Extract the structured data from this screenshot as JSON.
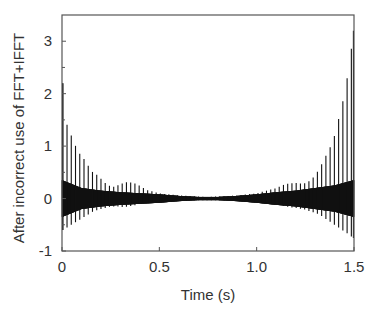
{
  "chart_data": {
    "type": "line",
    "title": "",
    "xlabel": "Time (s)",
    "ylabel": "After incorrect use of FFT+IFFT",
    "xlim": [
      0,
      1.5
    ],
    "ylim": [
      -1,
      3.5
    ],
    "grid": false,
    "legend": null,
    "xticks": [
      0,
      0.5,
      1.0,
      1.5
    ],
    "xtick_labels": [
      "0",
      "0.5",
      "1.0",
      "1.5"
    ],
    "yticks": [
      -1,
      0,
      1,
      2,
      3
    ],
    "ytick_labels": [
      "-1",
      "0",
      "1",
      "2",
      "3"
    ],
    "series": [
      {
        "name": "signal",
        "color": "#111111",
        "description": "Dense oscillation around 0 with periodic spikes; large spikes at both ends decaying toward the middle, small bump near t≈0.35 s and t≈1.15 s",
        "spike_peaks": {
          "t": [
            0.005,
            0.026,
            0.048,
            0.07,
            0.092,
            0.114,
            0.136,
            0.158,
            0.18,
            0.2,
            0.22,
            0.24,
            0.26,
            0.28,
            0.3,
            0.32,
            0.34,
            0.36,
            0.38,
            0.4,
            0.42,
            0.44,
            0.46,
            0.48,
            0.5,
            0.6,
            0.7,
            0.75,
            0.8,
            0.9,
            1.0,
            1.1,
            1.15,
            1.2,
            1.24,
            1.28,
            1.32,
            1.34,
            1.36,
            1.38,
            1.4,
            1.42,
            1.44,
            1.46,
            1.48,
            1.495
          ],
          "max": [
            2.2,
            1.4,
            1.2,
            1.0,
            0.85,
            0.75,
            0.62,
            0.5,
            0.45,
            0.38,
            0.3,
            0.25,
            0.22,
            0.24,
            0.28,
            0.3,
            0.32,
            0.3,
            0.28,
            0.24,
            0.2,
            0.16,
            0.14,
            0.12,
            0.1,
            0.06,
            0.04,
            0.03,
            0.04,
            0.06,
            0.1,
            0.2,
            0.28,
            0.3,
            0.28,
            0.35,
            0.55,
            0.7,
            0.85,
            1.0,
            1.2,
            1.5,
            1.8,
            2.2,
            2.6,
            3.2
          ],
          "min": [
            -0.6,
            -0.55,
            -0.5,
            -0.45,
            -0.4,
            -0.35,
            -0.3,
            -0.25,
            -0.22,
            -0.2,
            -0.18,
            -0.16,
            -0.15,
            -0.15,
            -0.16,
            -0.16,
            -0.15,
            -0.14,
            -0.12,
            -0.1,
            -0.08,
            -0.07,
            -0.06,
            -0.05,
            -0.05,
            -0.04,
            -0.03,
            -0.03,
            -0.03,
            -0.04,
            -0.06,
            -0.1,
            -0.15,
            -0.18,
            -0.2,
            -0.25,
            -0.3,
            -0.35,
            -0.4,
            -0.45,
            -0.5,
            -0.55,
            -0.6,
            -0.65,
            -0.7,
            -0.75
          ]
        },
        "envelope": {
          "t": [
            0,
            0.1,
            0.2,
            0.3,
            0.4,
            0.5,
            0.6,
            0.7,
            0.8,
            0.9,
            1.0,
            1.1,
            1.2,
            1.3,
            1.4,
            1.5
          ],
          "upper": [
            0.35,
            0.2,
            0.15,
            0.12,
            0.1,
            0.08,
            0.05,
            0.03,
            0.03,
            0.05,
            0.08,
            0.12,
            0.15,
            0.2,
            0.25,
            0.35
          ],
          "lower": [
            -0.35,
            -0.2,
            -0.15,
            -0.12,
            -0.1,
            -0.08,
            -0.05,
            -0.03,
            -0.03,
            -0.05,
            -0.08,
            -0.12,
            -0.15,
            -0.2,
            -0.25,
            -0.35
          ]
        }
      }
    ]
  },
  "colors": {
    "axis": "#555555",
    "text": "#333333",
    "line": "#111111",
    "background": "#ffffff"
  }
}
